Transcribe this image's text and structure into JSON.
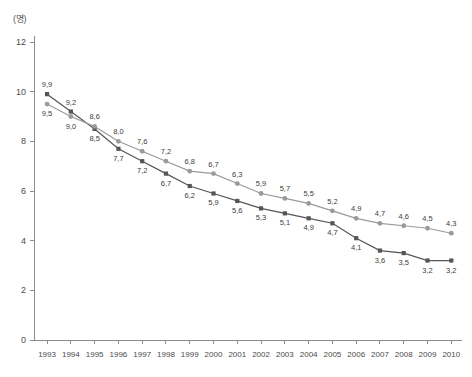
{
  "unit_label": "(명)",
  "axis": {
    "y_ticks": [
      "12",
      "10",
      "8",
      "6",
      "4",
      "2",
      "0"
    ],
    "x_ticks": [
      "1993",
      "1994",
      "1995",
      "1996",
      "1997",
      "1998",
      "1999",
      "2000",
      "2001",
      "2002",
      "2003",
      "2004",
      "2005",
      "2006",
      "2007",
      "2008",
      "2009",
      "2010"
    ]
  },
  "colors": {
    "series_dark": "#555555",
    "series_gray": "#9a9a9a",
    "axis": "#8c8c8c",
    "text": "#4a4a4a",
    "background": "#ffffff"
  },
  "chart_data": {
    "type": "line",
    "title": "",
    "subtitle": "",
    "xlabel": "",
    "ylabel": "(명)",
    "ylim": [
      0,
      12
    ],
    "ytick_step": 2,
    "grid": false,
    "legend": "none",
    "x": [
      "1993",
      "1994",
      "1995",
      "1996",
      "1997",
      "1998",
      "1999",
      "2000",
      "2001",
      "2002",
      "2003",
      "2004",
      "2005",
      "2006",
      "2007",
      "2008",
      "2009",
      "2010"
    ],
    "series": [
      {
        "name": "series-square",
        "marker": "square",
        "color": "#555555",
        "values": [
          9.9,
          9.2,
          8.5,
          7.7,
          7.2,
          6.7,
          6.2,
          5.9,
          5.6,
          5.3,
          5.1,
          4.9,
          4.7,
          4.1,
          3.6,
          3.5,
          3.2,
          3.2
        ],
        "labels": [
          "9,9",
          "9,2",
          "8,5",
          "7,7",
          "7,2",
          "6,7",
          "6,2",
          "5,9",
          "5,6",
          "5,3",
          "5,1",
          "4,9",
          "4,7",
          "4,1",
          "3,6",
          "3,5",
          "3,2",
          "3,2"
        ],
        "label_positions": [
          "above",
          "above",
          "below",
          "below",
          "below",
          "below",
          "below",
          "below",
          "below",
          "below",
          "below",
          "below",
          "below",
          "below",
          "below",
          "below",
          "below",
          "below"
        ]
      },
      {
        "name": "series-circle",
        "marker": "circle",
        "color": "#9a9a9a",
        "values": [
          9.5,
          9.0,
          8.6,
          8.0,
          7.6,
          7.2,
          6.8,
          6.7,
          6.3,
          5.9,
          5.7,
          5.5,
          5.2,
          4.9,
          4.7,
          4.6,
          4.5,
          4.3
        ],
        "labels": [
          "9,5",
          "9,0",
          "8,6",
          "8,0",
          "7,6",
          "7,2",
          "6,8",
          "6,7",
          "6,3",
          "5,9",
          "5,7",
          "5,5",
          "5,2",
          "4,9",
          "4,7",
          "4,6",
          "4,5",
          "4,3"
        ],
        "label_positions": [
          "below",
          "below",
          "above",
          "above",
          "above",
          "above",
          "above",
          "above",
          "above",
          "above",
          "above",
          "above",
          "above",
          "above",
          "above",
          "above",
          "above",
          "above"
        ]
      }
    ]
  }
}
